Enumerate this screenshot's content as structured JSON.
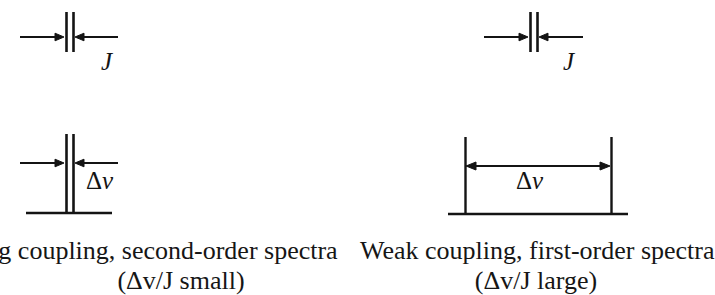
{
  "figure": {
    "background_color": "#ffffff",
    "ink_color": "#141414",
    "panels": [
      {
        "id": "strong-coupling",
        "caption_line1": "Strong coupling, second-order spectra",
        "caption_line1_visible": "ling, second-order spectra",
        "caption_line2": "(Δv/J small)",
        "diagrams": [
          {
            "id": "j-splitting-strong",
            "label": "J",
            "label_style": "italic",
            "type": "inward-arrows-between-two-close-lines",
            "line_count": 2,
            "line_separation_px": 7,
            "line_x_px": [
              66,
              73
            ],
            "line_top_px": 12,
            "line_bottom_px": 52,
            "arrow_y_px": 37,
            "left_arrow_from_x_px": 20,
            "left_arrow_to_x_px": 64,
            "right_arrow_from_x_px": 118,
            "right_arrow_to_x_px": 75,
            "has_baseline": false
          },
          {
            "id": "delta-nu-strong",
            "label": "Δv",
            "label_delta": "Δ",
            "label_nu": "v",
            "type": "inward-arrows-between-two-close-lines-on-baseline",
            "line_count": 2,
            "line_separation_px": 7,
            "line_x_px": [
              66,
              73
            ],
            "line_top_px": 134,
            "line_bottom_px": 213,
            "arrow_y_px": 163,
            "left_arrow_from_x_px": 20,
            "left_arrow_to_x_px": 64,
            "right_arrow_from_x_px": 118,
            "right_arrow_to_x_px": 75,
            "has_baseline": true,
            "baseline_y_px": 213,
            "baseline_x_start_px": 26,
            "baseline_x_end_px": 112
          }
        ]
      },
      {
        "id": "weak-coupling",
        "caption_line1": "Weak coupling, first-order spectra",
        "caption_line1_visible": "Weak coupling, first-order spectra",
        "caption_line2": "(Δv/J large)",
        "diagrams": [
          {
            "id": "j-splitting-weak",
            "label": "J",
            "label_style": "italic",
            "type": "inward-arrows-between-two-close-lines",
            "line_count": 2,
            "line_separation_px": 7,
            "line_x_px": [
              530,
              537
            ],
            "line_top_px": 12,
            "line_bottom_px": 52,
            "arrow_y_px": 37,
            "left_arrow_from_x_px": 484,
            "left_arrow_to_x_px": 528,
            "right_arrow_from_x_px": 583,
            "right_arrow_to_x_px": 539,
            "has_baseline": false
          },
          {
            "id": "delta-nu-weak",
            "label": "Δv",
            "label_delta": "Δ",
            "label_nu": "v",
            "type": "double-headed-arrow-between-two-wide-lines-on-baseline",
            "line_count": 2,
            "line_separation_px": 146,
            "line_x_px": [
              465,
              611
            ],
            "line_top_px": 137,
            "line_bottom_px": 213,
            "arrow_y_px": 166,
            "arrow_from_x_px": 466,
            "arrow_to_x_px": 610,
            "has_baseline": true,
            "baseline_y_px": 214,
            "baseline_x_start_px": 448,
            "baseline_x_end_px": 628
          }
        ]
      }
    ]
  }
}
